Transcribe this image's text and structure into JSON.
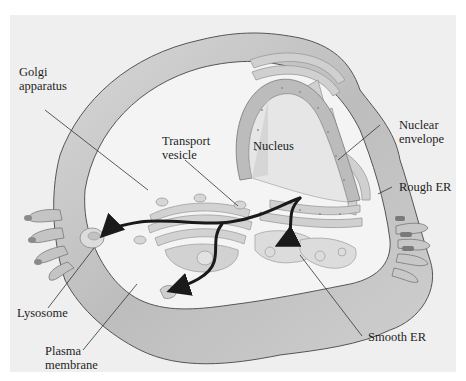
{
  "diagram": {
    "type": "cell-secretory-pathway",
    "colors": {
      "background": "#efefef",
      "cell_membrane_fill": "#c8c8c8",
      "cytoplasm": "#f4f4f4",
      "organelle_fill": "#d2d2d2",
      "organelle_stroke": "#9a9a9a",
      "arrow": "#1a1a1a",
      "leader_line": "#333333"
    },
    "labels": {
      "golgi": "Golgi\napparatus",
      "transport_vesicle": "Transport\nvesicle",
      "nucleus": "Nucleus",
      "nuclear_envelope": "Nuclear\nenvelope",
      "rough_er": "Rough ER",
      "lysosome": "Lysosome",
      "plasma_membrane": "Plasma\nmembrane",
      "smooth_er": "Smooth ER"
    },
    "arrows": [
      {
        "from": "rough-er",
        "to": "lysosome"
      },
      {
        "from": "rough-er",
        "to": "plasma-membrane"
      },
      {
        "from": "rough-er",
        "to": "smooth-er"
      }
    ]
  }
}
